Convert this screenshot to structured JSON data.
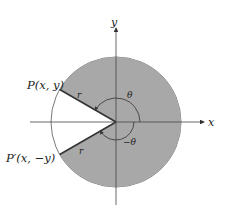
{
  "diagram": {
    "axes": {
      "x_label": "x",
      "y_label": "y"
    },
    "points": {
      "P": "P(x, y)",
      "P_prime": "P′(x, −y)"
    },
    "radius_label_upper": "r",
    "radius_label_lower": "r",
    "angle_labels": {
      "positive": "θ",
      "negative": "−θ"
    },
    "colors": {
      "shaded": "#a8a8a8",
      "stroke": "#333333",
      "background": "#ffffff"
    }
  }
}
